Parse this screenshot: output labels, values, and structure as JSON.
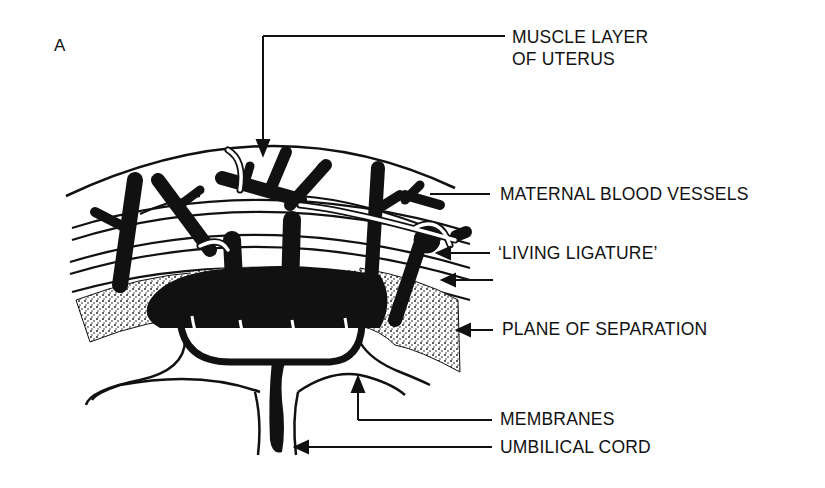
{
  "figure": {
    "panel_letter": "A"
  },
  "labels": {
    "muscle_layer_line1": "MUSCLE LAYER",
    "muscle_layer_line2": "OF UTERUS",
    "maternal_blood_vessels": "MATERNAL BLOOD VESSELS",
    "living_ligature": "‘LIVING LIGATURE’",
    "plane_of_separation": "PLANE OF SEPARATION",
    "membranes": "MEMBRANES",
    "umbilical_cord": "UMBILICAL CORD"
  },
  "colors": {
    "ink": "#111111",
    "background": "#ffffff"
  }
}
